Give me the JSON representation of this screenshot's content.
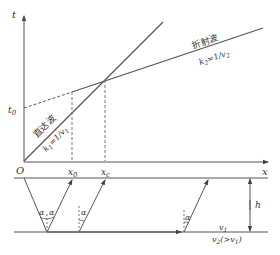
{
  "diagram": {
    "type": "seismic refraction travel-time diagram",
    "upper_plot": {
      "y_axis_label": "t",
      "x_axis_label": "x",
      "origin_label": "O",
      "t0_label": "t0",
      "x0_label": "x0",
      "xc_label": "xc",
      "direct_wave": {
        "name": "直达波",
        "slope_label": "k1=1/v1"
      },
      "refracted_wave": {
        "name": "折射波",
        "slope_label": "k2=1/v2"
      }
    },
    "lower_plot": {
      "thickness_label": "h",
      "upper_layer_velocity": "v1",
      "lower_layer_velocity": "v2(>v1)",
      "angle_label": "α"
    },
    "colors": {
      "line": "#555555",
      "text": "#333333",
      "background": "#ffffff"
    }
  }
}
